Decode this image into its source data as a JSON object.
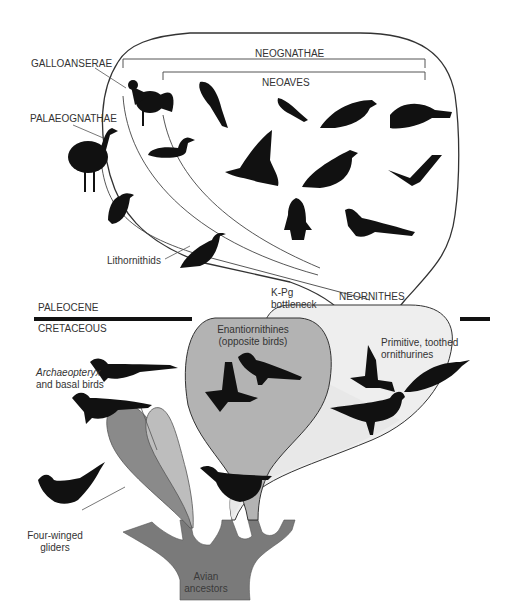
{
  "diagram": {
    "type": "phylogeny-illustration",
    "colors": {
      "background": "#ffffff",
      "outline": "#333333",
      "silhouette": "#111111",
      "enantiornithines_fill": "#b3b3b3",
      "ornithurine_fill_light": "#e6e6e6",
      "four_winged_fill": "#8a8a8a",
      "basal_birds_fill": "#bdbdbd",
      "ancestor_trunk": "#7a7a7a",
      "boundary_bar": "#111111"
    },
    "time_periods": {
      "upper": "PALEOCENE",
      "lower": "CRETACEOUS"
    },
    "clade_labels": {
      "neognathae": "NEOGNATHAE",
      "neoaves": "NEOAVES",
      "galloanserae": "GALLOANSERAE",
      "palaeognathae": "PALAEOGNATHAE",
      "lithornithids": "Lithornithids",
      "neornithes": "NEORNITHES",
      "kpg_line1": "K-Pg",
      "kpg_line2": "bottleneck",
      "enantiornithines_line1": "Enantiornithines",
      "enantiornithines_line2": "(opposite birds)",
      "ornithurines_line1": "Primitive, toothed",
      "ornithurines_line2": "ornithurines",
      "archaeopteryx_italic": "Archaeopteryx",
      "archaeopteryx_line2": "and basal birds",
      "fourwinged_line1": "Four-winged",
      "fourwinged_line2": "gliders",
      "ancestors_line1": "Avian",
      "ancestors_line2": "ancestors"
    },
    "silhouettes": [
      "rooster",
      "parrot",
      "small-songbird",
      "perching-bird",
      "cuckoo-bird",
      "emu",
      "duck",
      "pelican",
      "pigeon",
      "swallow",
      "tinamou",
      "penguin",
      "pheasant-tail-bird",
      "lithornithid",
      "enantiornithine-flying",
      "enantiornithine-standing",
      "ornithurine-flying",
      "ornithurine-swimmer",
      "ornithurine-standing",
      "archaeopteryx",
      "basal-bird",
      "microraptor",
      "ornithurine-ancestor"
    ]
  }
}
